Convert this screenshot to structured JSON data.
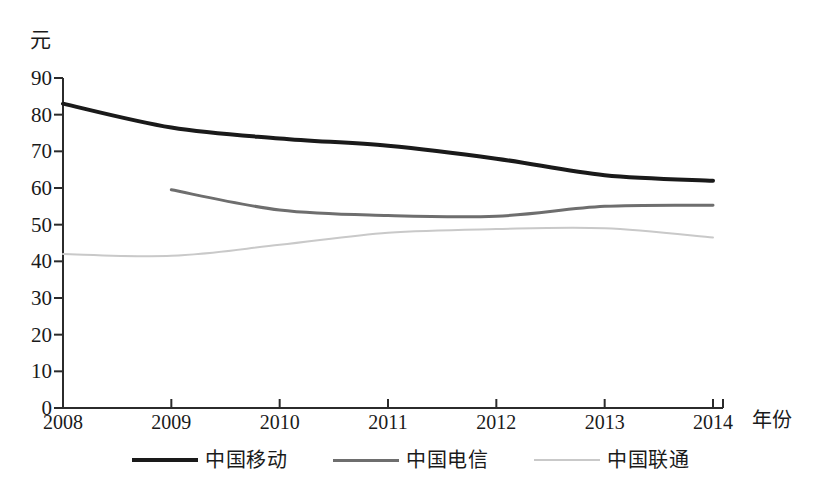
{
  "chart_data": {
    "type": "line",
    "title": "",
    "xlabel": "年份",
    "ylabel": "元",
    "x": [
      2008,
      2009,
      2010,
      2011,
      2012,
      2013,
      2014
    ],
    "categories": [
      "2008",
      "2009",
      "2010",
      "2011",
      "2012",
      "2013",
      "2014"
    ],
    "ylim": [
      0,
      90
    ],
    "yticks": [
      0,
      10,
      20,
      30,
      40,
      50,
      60,
      70,
      80,
      90
    ],
    "ytick_labels": [
      "0",
      "10",
      "20",
      "30",
      "40",
      "50",
      "60",
      "70",
      "80",
      "90"
    ],
    "xlim": [
      2008,
      2014
    ],
    "grid": false,
    "legend_position": "bottom-center",
    "series": [
      {
        "name": "中国移动",
        "color": "#1a1a1a",
        "width": 4,
        "style": "solid",
        "x": [
          2008,
          2009,
          2010,
          2011,
          2012,
          2013,
          2014
        ],
        "values": [
          83.0,
          76.5,
          73.5,
          71.5,
          68.0,
          63.5,
          62.0
        ]
      },
      {
        "name": "中国电信",
        "color": "#6e6e6e",
        "width": 3,
        "style": "solid",
        "x": [
          2009,
          2010,
          2011,
          2012,
          2013,
          2014
        ],
        "values": [
          59.5,
          54.0,
          52.5,
          52.3,
          55.0,
          55.3
        ]
      },
      {
        "name": "中国联通",
        "color": "#c9c9c9",
        "width": 2,
        "style": "solid",
        "x": [
          2008,
          2009,
          2010,
          2011,
          2012,
          2013,
          2014
        ],
        "values": [
          42.0,
          41.5,
          44.5,
          47.8,
          48.8,
          49.0,
          46.5
        ]
      }
    ]
  },
  "axis": {
    "unit_label": "元",
    "x_axis_label": "年份"
  },
  "legend": {
    "items": [
      {
        "label": "中国移动",
        "color": "#1a1a1a"
      },
      {
        "label": "中国电信",
        "color": "#6e6e6e"
      },
      {
        "label": "中国联通",
        "color": "#c9c9c9"
      }
    ]
  }
}
